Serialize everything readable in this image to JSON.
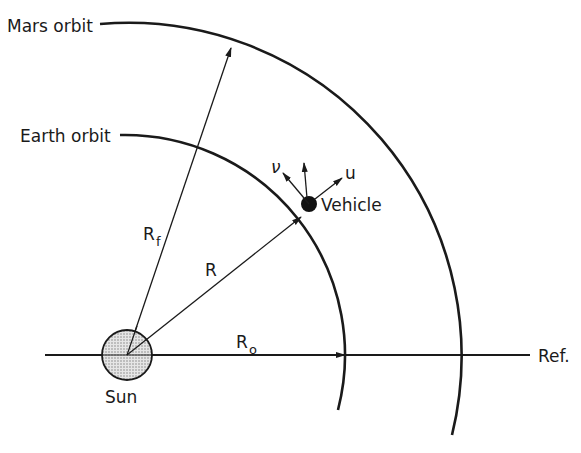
{
  "labels": {
    "mars_orbit": "Mars orbit",
    "earth_orbit": "Earth orbit",
    "vehicle": "Vehicle",
    "sun": "Sun",
    "ref": "Ref.",
    "r": "R",
    "rf_main": "R",
    "rf_sub": "f",
    "ro_main": "R",
    "ro_sub": "o",
    "u": "u",
    "v": "ν"
  }
}
